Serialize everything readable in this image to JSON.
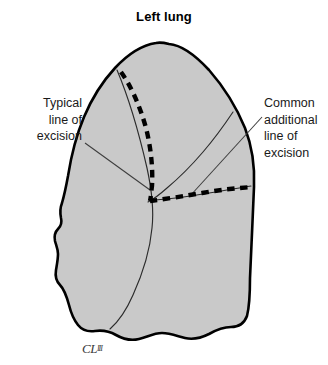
{
  "figure": {
    "title": "Left lung",
    "signature_main": "CL",
    "signature_mark": "III"
  },
  "annotations": [
    {
      "id": "typical-line-of-excision",
      "text": "Typical\nline of\nexcision",
      "align": "right"
    },
    {
      "id": "common-additional-line-of-excision",
      "text": "Common\nadditional\nline of\nexcision",
      "align": "left"
    }
  ],
  "colors": {
    "lung_fill": "#c9c9c9",
    "lung_outline": "#000000",
    "fissure_line": "#2b2b2b",
    "excision_dash": "#000000",
    "leader_line": "#3d3d3d",
    "text": "#1a1a1a",
    "background": "#ffffff"
  },
  "graphics": {
    "lung_outline_path": "M 169 44 C 182 45 196 56 209 70 C 223 86 236 106 245 128 C 252 146 255 166 254 187 C 253 216 251 250 250 278 C 250 295 249 308 247 316 C 244 324 238 327 231 327 C 223 327 216 330 209 334 C 201 338 193 340 185 338 C 177 336 170 333 162 333 C 154 333 147 337 139 339 C 131 341 123 339 116 335 C 109 331 102 330 95 331 C 88 332 82 330 78 325 C 74 320 71 313 69 305 C 66 294 63 288 60 285 C 56 281 55 276 56 270 C 57 264 58 259 58 254 C 58 249 56 245 55 241 C 54 236 55 232 58 229 C 61 226 62 222 61 218 C 60 213 60 208 62 203 C 64 196 66 187 68 176 C 71 157 76 136 84 117 C 92 98 103 81 115 68 C 128 54 143 45 156 43 C 160 42 165 43 169 44 Z",
    "oblique_fissure_path": "M 117 70 C 128 96 139 133 147 168 C 152 191 154 210 152 228 C 150 250 143 273 133 295 C 126 311 118 322 110 329",
    "secondary_fissure_path": "M 233 112 C 225 124 215 138 203 152 C 191 166 179 178 167 188 C 158 196 152 200 148 202",
    "third_fissure_path": "M 251 186 C 238 188 221 191 203 194 C 185 197 168 199 155 200",
    "dash_vertical_path": "M 121 72 C 131 86 140 106 146 128 C 151 148 153 168 152 186 C 151 193 151 197 150 201",
    "dash_horizontal_path": "M 150 201 C 166 199 184 196 202 193 C 219 190 236 188 253 187",
    "leader_left_path": "M 85 143 L 150 190",
    "leader_right_path": "M 262 117 L 190 196"
  }
}
